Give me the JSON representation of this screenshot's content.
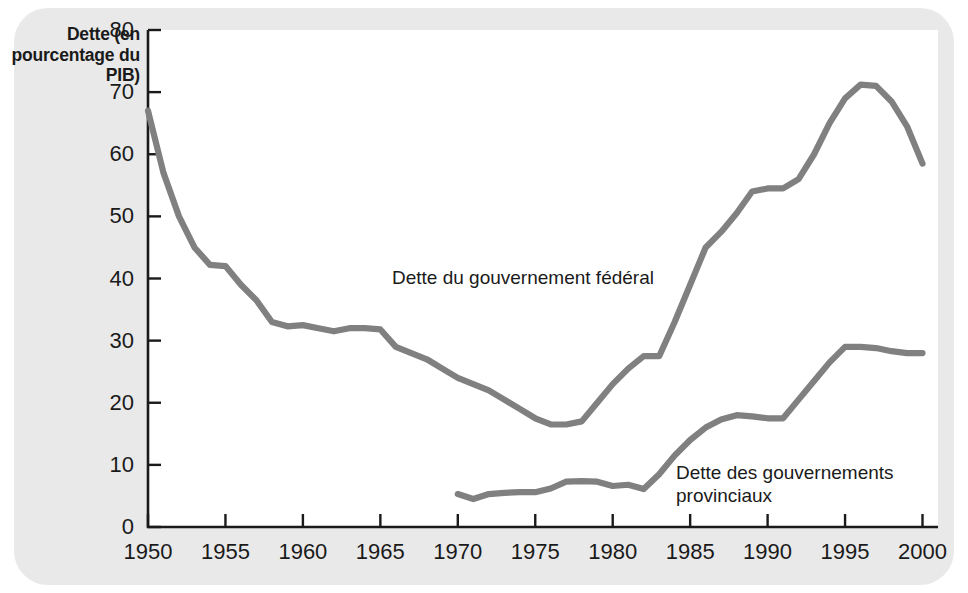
{
  "chart_data": {
    "type": "line",
    "title": "",
    "subtitle": "",
    "xlabel": "",
    "ylabel": "Dette (en\npourcentage\ndu PIB)",
    "xlim": [
      1950,
      2001
    ],
    "ylim": [
      0,
      80
    ],
    "x_ticks": [
      1950,
      1955,
      1960,
      1965,
      1970,
      1975,
      1980,
      1985,
      1990,
      1995,
      2000
    ],
    "x_tick_labels": [
      "1950",
      "1955",
      "1960",
      "1965",
      "1970",
      "1975",
      "1980",
      "1985",
      "1990",
      "1995",
      "2000"
    ],
    "y_ticks": [
      0,
      10,
      20,
      30,
      40,
      50,
      60,
      70,
      80
    ],
    "y_tick_labels": [
      "0",
      "10",
      "20",
      "30",
      "40",
      "50",
      "60",
      "70",
      "80"
    ],
    "grid": false,
    "legend_position": "inline-annotation",
    "line_color": "#808080",
    "axis_color": "#1a1a1a",
    "panel_color": "#e9e9e9",
    "plot_background": "#ffffff",
    "series": [
      {
        "name": "Dette du gouvernement fédéral",
        "color": "#808080",
        "x": [
          1950,
          1951,
          1952,
          1953,
          1954,
          1955,
          1956,
          1957,
          1958,
          1959,
          1960,
          1961,
          1962,
          1963,
          1964,
          1965,
          1966,
          1967,
          1968,
          1969,
          1970,
          1971,
          1972,
          1973,
          1974,
          1975,
          1976,
          1977,
          1978,
          1979,
          1980,
          1981,
          1982,
          1983,
          1984,
          1985,
          1986,
          1987,
          1988,
          1989,
          1990,
          1991,
          1992,
          1993,
          1994,
          1995,
          1996,
          1997,
          1998,
          1999,
          2000
        ],
        "values": [
          67.0,
          57.0,
          50.0,
          45.0,
          42.2,
          42.0,
          39.0,
          36.5,
          33.0,
          32.3,
          32.5,
          32.0,
          31.5,
          32.0,
          32.0,
          31.8,
          29.0,
          28.0,
          27.0,
          25.5,
          24.0,
          23.0,
          22.0,
          20.5,
          19.0,
          17.5,
          16.5,
          16.5,
          17.0,
          20.0,
          23.0,
          25.5,
          27.5,
          27.5,
          33.0,
          39.0,
          45.0,
          47.5,
          50.5,
          54.0,
          54.5,
          54.5,
          56.0,
          60.0,
          65.0,
          69.0,
          71.2,
          71.0,
          68.5,
          64.5,
          58.5
        ]
      },
      {
        "name": "Dette des gouvernements provinciaux",
        "color": "#808080",
        "x": [
          1970,
          1971,
          1972,
          1973,
          1974,
          1975,
          1976,
          1977,
          1978,
          1979,
          1980,
          1981,
          1982,
          1983,
          1984,
          1985,
          1986,
          1987,
          1988,
          1989,
          1990,
          1991,
          1992,
          1993,
          1994,
          1995,
          1996,
          1997,
          1998,
          1999,
          2000
        ],
        "values": [
          5.3,
          4.5,
          5.3,
          5.5,
          5.6,
          5.6,
          6.2,
          7.3,
          7.4,
          7.3,
          6.6,
          6.8,
          6.1,
          8.5,
          11.5,
          14.0,
          16.0,
          17.3,
          18.0,
          17.8,
          17.5,
          17.5,
          20.5,
          23.5,
          26.5,
          29.0,
          29.0,
          28.8,
          28.3,
          28.0,
          28.0
        ]
      }
    ],
    "annotations": [
      {
        "name": "federal-label",
        "text": "Dette du gouvernement fédéral"
      },
      {
        "name": "provincial-label",
        "text": "Dette des gouvernements\nprovinciaux"
      }
    ]
  }
}
